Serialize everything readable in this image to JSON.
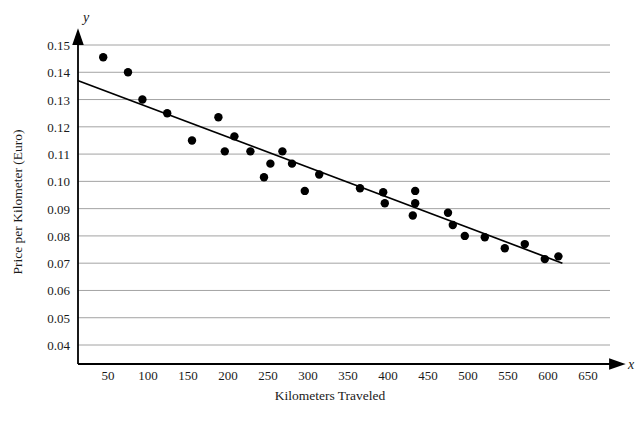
{
  "chart_data": {
    "type": "scatter",
    "title": "",
    "xlabel": "Kilometers Traveled",
    "ylabel": "Price per Kilometer (Euro)",
    "x_axis_variable": "x",
    "y_axis_variable": "y",
    "xlim": [
      0,
      680
    ],
    "ylim": [
      0.035,
      0.153
    ],
    "xticks": [
      50,
      100,
      150,
      200,
      250,
      300,
      350,
      400,
      450,
      500,
      550,
      600,
      650
    ],
    "xtick_labels": [
      "50",
      "100",
      "150",
      "200",
      "250",
      "300",
      "350",
      "400",
      "450",
      "500",
      "550",
      "600",
      "650"
    ],
    "yticks": [
      0.04,
      0.05,
      0.06,
      0.07,
      0.08,
      0.09,
      0.1,
      0.11,
      0.12,
      0.13,
      0.14,
      0.15
    ],
    "ytick_labels": [
      "0.04",
      "0.05",
      "0.06",
      "0.07",
      "0.08",
      "0.09",
      "0.10",
      "0.11",
      "0.12",
      "0.13",
      "0.14",
      "0.15"
    ],
    "grid": "horizontal",
    "legend": "none",
    "point_color": "#000000",
    "line_color": "#000000",
    "grid_color": "#8c8c8c",
    "points": [
      [
        44,
        0.1455
      ],
      [
        75,
        0.14
      ],
      [
        93,
        0.13
      ],
      [
        124,
        0.125
      ],
      [
        155,
        0.115
      ],
      [
        188,
        0.1235
      ],
      [
        208,
        0.1165
      ],
      [
        196,
        0.111
      ],
      [
        228,
        0.111
      ],
      [
        245,
        0.1015
      ],
      [
        253,
        0.1065
      ],
      [
        268,
        0.111
      ],
      [
        280,
        0.1065
      ],
      [
        296,
        0.0965
      ],
      [
        314,
        0.1025
      ],
      [
        365,
        0.0975
      ],
      [
        394,
        0.096
      ],
      [
        396,
        0.092
      ],
      [
        431,
        0.0875
      ],
      [
        434,
        0.0965
      ],
      [
        434,
        0.092
      ],
      [
        475,
        0.0885
      ],
      [
        481,
        0.084
      ],
      [
        496,
        0.08
      ],
      [
        521,
        0.0795
      ],
      [
        546,
        0.0755
      ],
      [
        571,
        0.077
      ],
      [
        596,
        0.0715
      ],
      [
        613,
        0.0725
      ]
    ],
    "trend_line": {
      "x_start": 12,
      "y_start": 0.137,
      "x_end": 618,
      "y_end": 0.07
    }
  }
}
